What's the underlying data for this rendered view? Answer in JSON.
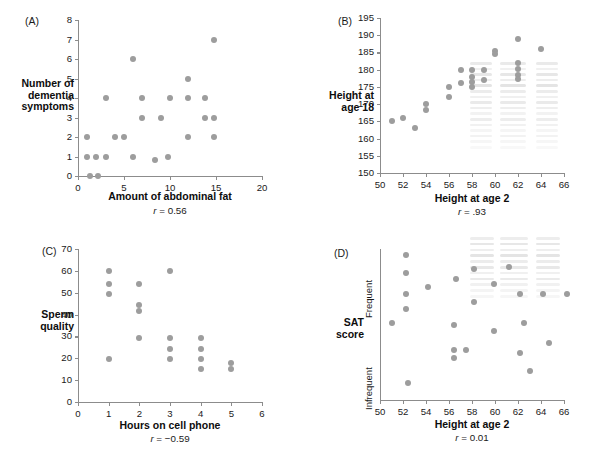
{
  "figure": {
    "dot_color": "#9d9d9d",
    "axis_color": "#8c8c8c"
  },
  "chart_data": [
    {
      "type": "scatter",
      "panel": "(A)",
      "title": "",
      "xlabel": "Amount of abdominal fat",
      "ylabel": "Number of\ndementia\nsymptoms",
      "annotation": "r = 0.56",
      "r_prefix": "r",
      "r_value": " = 0.56",
      "xlim": [
        0,
        20
      ],
      "ylim": [
        0,
        8
      ],
      "xticks": [
        0,
        5,
        10,
        15,
        20
      ],
      "yticks": [
        0,
        1,
        2,
        3,
        4,
        5,
        6,
        7,
        8
      ],
      "grid": false,
      "points": [
        [
          1,
          2
        ],
        [
          1,
          1
        ],
        [
          1.3,
          0
        ],
        [
          2,
          1
        ],
        [
          2.2,
          0
        ],
        [
          3,
          1
        ],
        [
          3,
          4
        ],
        [
          4,
          2
        ],
        [
          5,
          2
        ],
        [
          6,
          6
        ],
        [
          6,
          1
        ],
        [
          7,
          3
        ],
        [
          7,
          4
        ],
        [
          8.4,
          0.8
        ],
        [
          9,
          3
        ],
        [
          9.8,
          1
        ],
        [
          10,
          4
        ],
        [
          11.9,
          5
        ],
        [
          11.9,
          4
        ],
        [
          11.9,
          2
        ],
        [
          13.8,
          4
        ],
        [
          13.8,
          3
        ],
        [
          14.8,
          7
        ],
        [
          14.8,
          3
        ],
        [
          14.8,
          2
        ]
      ]
    },
    {
      "type": "scatter",
      "panel": "(B)",
      "title": "",
      "xlabel": "Height at age 2",
      "ylabel": "Height at\nage 18",
      "annotation": "r = .93",
      "r_prefix": "r",
      "r_value": " = .93",
      "xlim": [
        50,
        66
      ],
      "ylim": [
        150,
        195
      ],
      "xticks": [
        50,
        52,
        54,
        56,
        58,
        60,
        62,
        64,
        66
      ],
      "yticks": [
        150,
        155,
        160,
        165,
        170,
        175,
        180,
        185,
        190,
        195
      ],
      "grid": false,
      "points": [
        [
          51,
          165
        ],
        [
          52,
          166
        ],
        [
          53,
          163
        ],
        [
          54,
          170
        ],
        [
          54,
          168.2
        ],
        [
          56,
          175
        ],
        [
          56,
          172
        ],
        [
          57,
          180
        ],
        [
          57,
          176
        ],
        [
          58,
          180
        ],
        [
          58,
          178
        ],
        [
          58,
          176.5
        ],
        [
          58,
          175
        ],
        [
          59,
          180
        ],
        [
          59,
          177
        ],
        [
          60,
          185.5
        ],
        [
          60,
          184.6
        ],
        [
          62,
          189
        ],
        [
          62,
          182
        ],
        [
          62,
          180.2
        ],
        [
          62,
          178.6
        ],
        [
          62,
          177.2
        ],
        [
          64,
          186
        ]
      ]
    },
    {
      "type": "scatter",
      "panel": "(C)",
      "title": "",
      "xlabel": "Hours on cell phone",
      "ylabel": "Sperm\nquality",
      "annotation": "r = −0.59",
      "r_prefix": "r",
      "r_value": " = −0.59",
      "xlim": [
        0,
        6
      ],
      "ylim": [
        0,
        70
      ],
      "xticks": [
        0,
        1,
        2,
        3,
        4,
        5,
        6
      ],
      "yticks": [
        0,
        10,
        20,
        30,
        40,
        50,
        60,
        70
      ],
      "grid": false,
      "points": [
        [
          1,
          60
        ],
        [
          1,
          54
        ],
        [
          1,
          49.5
        ],
        [
          1,
          19.5
        ],
        [
          2,
          54
        ],
        [
          2,
          44.5
        ],
        [
          2,
          41.5
        ],
        [
          2,
          29.5
        ],
        [
          3,
          60
        ],
        [
          3,
          29.5
        ],
        [
          3,
          24.5
        ],
        [
          3,
          19.5
        ],
        [
          4,
          29.5
        ],
        [
          4,
          24.5
        ],
        [
          4,
          19.5
        ],
        [
          4,
          15
        ],
        [
          5,
          18
        ],
        [
          5,
          15
        ]
      ]
    },
    {
      "type": "scatter",
      "panel": "(D)",
      "title": "",
      "xlabel": "Height at age 2",
      "ylabel": "SAT\nscore",
      "annotation": "r = 0.01",
      "r_prefix": "r",
      "r_value": " = 0.01",
      "xlim": [
        50,
        66
      ],
      "ylim": [
        0,
        100
      ],
      "xticks": [
        50,
        52,
        54,
        56,
        58,
        60,
        62,
        64,
        66
      ],
      "ycategories": [
        "Frequent",
        "Infrequent"
      ],
      "grid": false,
      "points": [
        [
          51,
          51
        ],
        [
          52.3,
          96
        ],
        [
          52.3,
          84
        ],
        [
          52.3,
          70
        ],
        [
          52.3,
          60
        ],
        [
          52.4,
          11
        ],
        [
          54.2,
          75
        ],
        [
          56.4,
          50
        ],
        [
          56.4,
          33
        ],
        [
          56.4,
          28
        ],
        [
          56.6,
          80
        ],
        [
          57.5,
          33
        ],
        [
          58.2,
          87
        ],
        [
          58.2,
          65
        ],
        [
          59.9,
          77
        ],
        [
          59.9,
          46
        ],
        [
          61.2,
          88
        ],
        [
          62.2,
          70
        ],
        [
          62.5,
          51
        ],
        [
          62.2,
          31
        ],
        [
          63,
          19
        ],
        [
          64.2,
          70
        ],
        [
          64.7,
          38
        ],
        [
          66.3,
          70
        ]
      ]
    }
  ]
}
